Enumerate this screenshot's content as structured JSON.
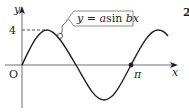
{
  "figure": {
    "question_number_partial": "2",
    "axes": {
      "x_label": "x",
      "y_label": "y",
      "origin_label": "O",
      "y_tick_label": "4",
      "x_tick_label": "π"
    },
    "curve_label": {
      "y": "y",
      "eq": " = ",
      "a": "a",
      "sin": "sin ",
      "bx": "bx"
    },
    "colors": {
      "ink": "#231f20",
      "background": "#ffffff"
    }
  }
}
